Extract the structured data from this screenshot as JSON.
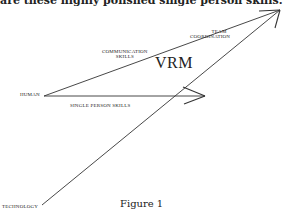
{
  "header": {
    "text": "are these highly polished single person skills."
  },
  "diagram": {
    "title": "VRM",
    "caption": "Figure 1",
    "labels": {
      "team_coordination_line1": "TEAM",
      "team_coordination_line2": "COORDINATION",
      "communication_skills_line1": "COMMUNICATION",
      "communication_skills_line2": "SKILLS",
      "human": "HUMAN",
      "single_person_skills": "SINGLE PERSON SKILLS",
      "technology": "TECHNOLOGY"
    },
    "vectors": [
      {
        "name": "human-to-team-coordination",
        "from": [
          44,
          96
        ],
        "to": [
          280,
          10
        ]
      },
      {
        "name": "human-to-single-person-skills",
        "from": [
          44,
          96
        ],
        "to": [
          205,
          96
        ]
      },
      {
        "name": "technology-to-team-coordination",
        "from": [
          42,
          205
        ],
        "to": [
          280,
          10
        ]
      }
    ],
    "line_color": "#333333"
  }
}
